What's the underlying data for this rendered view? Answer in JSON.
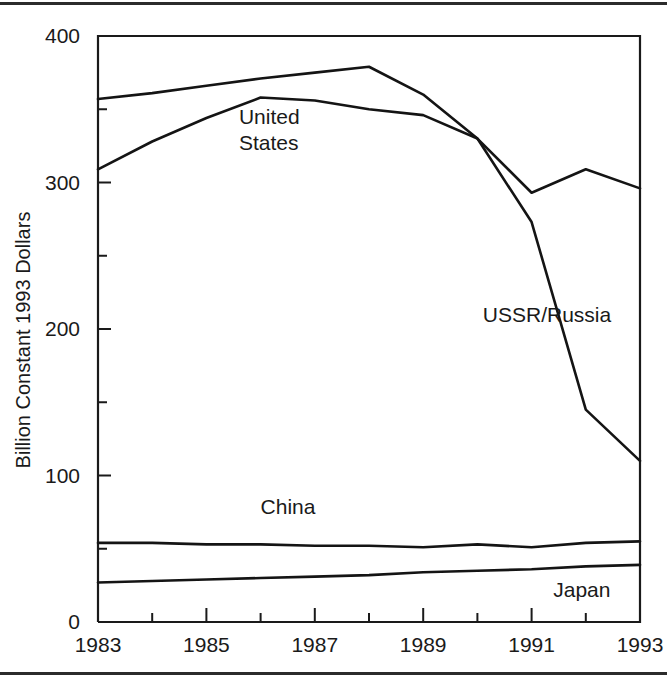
{
  "chart_data": {
    "type": "line",
    "title": "",
    "xlabel": "",
    "ylabel": "Billion Constant 1993 Dollars",
    "x": [
      1983,
      1984,
      1985,
      1986,
      1987,
      1988,
      1989,
      1990,
      1991,
      1992,
      1993
    ],
    "xlim": [
      1983,
      1993
    ],
    "ylim": [
      0,
      400
    ],
    "xticks": [
      "1983",
      "1985",
      "1987",
      "1989",
      "1991",
      "1993"
    ],
    "xtick_values": [
      1983,
      1985,
      1987,
      1989,
      1991,
      1993
    ],
    "xminor_values": [
      1984,
      1986,
      1988,
      1990,
      1992
    ],
    "yticks": [
      "0",
      "100",
      "200",
      "300",
      "400"
    ],
    "ytick_values": [
      0,
      100,
      200,
      300,
      400
    ],
    "yminor_values": [
      50,
      150,
      250,
      350
    ],
    "grid": false,
    "legend_position": "inline-annotations",
    "series": [
      {
        "name": "USSR/Russia",
        "values": [
          357,
          361,
          366,
          371,
          375,
          379,
          360,
          330,
          273,
          145,
          110
        ],
        "label_x": 1990.1,
        "label_y": 205
      },
      {
        "name": "United States",
        "values": [
          309,
          328,
          344,
          358,
          356,
          350,
          346,
          330,
          293,
          309,
          296
        ],
        "label_x": 1985.6,
        "label_y": 340,
        "label_lines": [
          "United",
          "States"
        ]
      },
      {
        "name": "China",
        "values": [
          54,
          54,
          53,
          53,
          52,
          52,
          51,
          53,
          51,
          54,
          55
        ],
        "label_x": 1986.0,
        "label_y": 74
      },
      {
        "name": "Japan",
        "values": [
          27,
          28,
          29,
          30,
          31,
          32,
          34,
          35,
          36,
          38,
          39
        ],
        "label_x": 1991.4,
        "label_y": 17
      }
    ]
  },
  "axes": {
    "y_axis_title": "Billion Constant 1993 Dollars"
  }
}
